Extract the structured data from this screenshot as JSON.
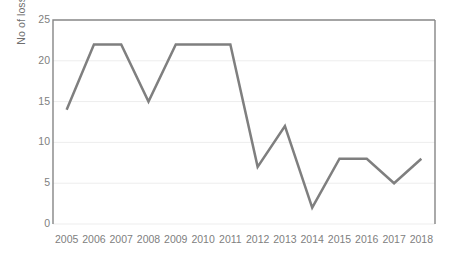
{
  "chart_data": {
    "type": "line",
    "title": "",
    "xlabel": "",
    "ylabel": "No of losses per year",
    "categories": [
      "2005",
      "2006",
      "2007",
      "2008",
      "2009",
      "2010",
      "2011",
      "2012",
      "2013",
      "2014",
      "2015",
      "2016",
      "2017",
      "2018"
    ],
    "values": [
      14,
      22,
      22,
      15,
      22,
      22,
      22,
      7,
      12,
      2,
      8,
      8,
      5,
      8
    ],
    "series": [
      {
        "name": "No of losses per year",
        "values": [
          14,
          22,
          22,
          15,
          22,
          22,
          22,
          7,
          12,
          2,
          8,
          8,
          5,
          8
        ],
        "color": "#7f7f7f"
      }
    ],
    "ylim": [
      0,
      25
    ],
    "yticks": [
      0,
      5,
      10,
      15,
      20,
      25
    ],
    "ytick_labels": [
      "0",
      "5",
      "10",
      "15",
      "20",
      "25"
    ],
    "grid": true,
    "grid_axis": "y",
    "legend": false,
    "legend_position": "none",
    "markers": false,
    "line_width": 2.5,
    "colors": {
      "line": "#7f7f7f",
      "axis": "#868686",
      "gridline": "#ededed",
      "tick_label": "#808080",
      "axis_title": "#6f6f6f",
      "background": "#ffffff"
    }
  }
}
